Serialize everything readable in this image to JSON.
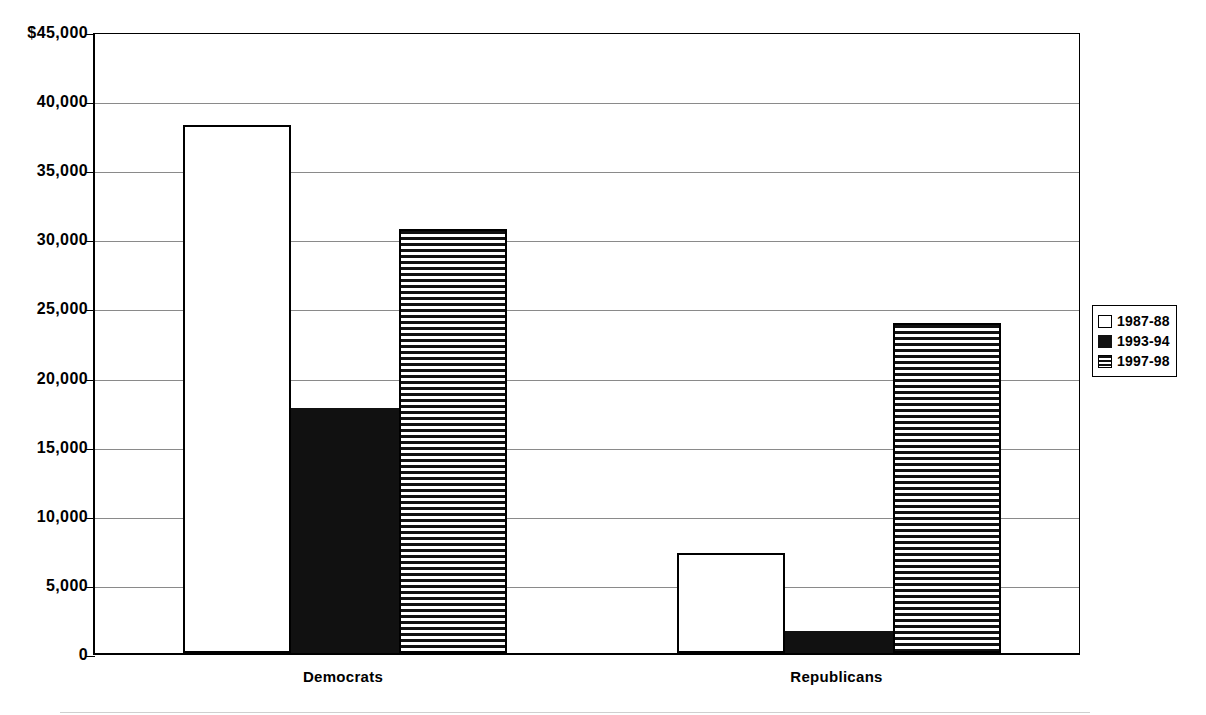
{
  "chart_data": {
    "type": "bar",
    "title": "",
    "subtitle": "",
    "xlabel": "",
    "ylabel": "",
    "categories": [
      "Democrats",
      "Republicans"
    ],
    "series": [
      {
        "name": "1987-88",
        "pattern": "open",
        "values": [
          38200,
          7200
        ]
      },
      {
        "name": "1993-94",
        "pattern": "solid",
        "values": [
          17700,
          1600
        ]
      },
      {
        "name": "1997-98",
        "pattern": "striped",
        "values": [
          30700,
          23900
        ]
      }
    ],
    "ylim": [
      0,
      45000
    ],
    "ytick_values": [
      0,
      5000,
      10000,
      15000,
      20000,
      25000,
      30000,
      35000,
      40000,
      45000
    ],
    "ytick_labels": [
      "0",
      "5,000",
      "10,000",
      "15,000",
      "20,000",
      "25,000",
      "30,000",
      "35,000",
      "40,000",
      "$45,000"
    ],
    "grid": true,
    "grid_axis": "y",
    "legend_position": "right",
    "legend_entries": [
      "1987-88",
      "1993-94",
      "1997-98"
    ],
    "colors": {
      "axis": "#000000",
      "gridline": "#8a8a8a",
      "bar_outline": "#000000",
      "bar_open_fill": "#ffffff",
      "bar_solid_fill": "#111111",
      "background": "#ffffff"
    }
  },
  "axis": {
    "y_ticks": [
      {
        "label": "$45,000",
        "value": 45000
      },
      {
        "label": "40,000",
        "value": 40000
      },
      {
        "label": "35,000",
        "value": 35000
      },
      {
        "label": "30,000",
        "value": 30000
      },
      {
        "label": "25,000",
        "value": 25000
      },
      {
        "label": "20,000",
        "value": 20000
      },
      {
        "label": "15,000",
        "value": 15000
      },
      {
        "label": "10,000",
        "value": 10000
      },
      {
        "label": "5,000",
        "value": 5000
      },
      {
        "label": "0",
        "value": 0
      }
    ],
    "x_categories": [
      {
        "label": "Democrats"
      },
      {
        "label": "Republicans"
      }
    ]
  },
  "legend": {
    "items": [
      {
        "label": "1987-88",
        "pattern": "open"
      },
      {
        "label": "1993-94",
        "pattern": "solid"
      },
      {
        "label": "1997-98",
        "pattern": "striped"
      }
    ]
  }
}
